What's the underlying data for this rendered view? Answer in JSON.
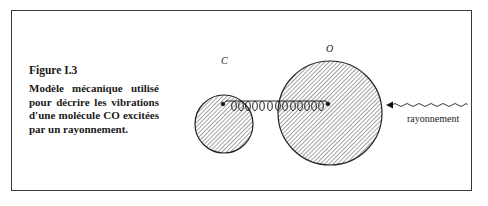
{
  "figure": {
    "title": "Figure I.3",
    "description": "Modèle mécanique utilisé pour décrire les vibrations d'une molécule CO excitées par un rayonnement."
  },
  "diagram": {
    "atom_small_label": "C",
    "atom_large_label": "O",
    "radiation_label": "rayonnement",
    "stroke_color": "#222222"
  }
}
